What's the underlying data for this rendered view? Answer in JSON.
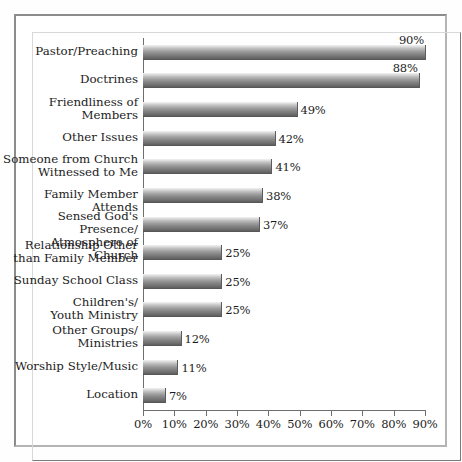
{
  "figure": {
    "background_color": "#ffffff",
    "frame_color": "#8c8c8c",
    "bar_color_top": "#f2f2f2",
    "bar_color_bottom": "#474747",
    "text_color": "#1c1c1c"
  },
  "chart_data": {
    "type": "bar",
    "orientation": "horizontal",
    "title": "",
    "subtitle": "",
    "xlabel": "",
    "ylabel": "",
    "xlim": [
      0,
      90
    ],
    "grid": false,
    "legend": false,
    "xticks": [
      0,
      10,
      20,
      30,
      40,
      50,
      60,
      70,
      80,
      90
    ],
    "xtick_labels": [
      "0%",
      "10%",
      "20%",
      "30%",
      "40%",
      "50%",
      "60%",
      "70%",
      "80%",
      "90%"
    ],
    "categories": [
      "Pastor/Preaching",
      "Doctrines",
      "Friendliness of\nMembers",
      "Other Issues",
      "Someone from Church\nWitnessed to Me",
      "Family Member Attends",
      "Sensed God's Presence/\nAtmosphere of Church",
      "Relationship Other\nthan Family Member",
      "Sunday School Class",
      "Children's/\nYouth Ministry",
      "Other Groups/\nMinistries",
      "Worship Style/Music",
      "Location"
    ],
    "values": [
      90,
      88,
      49,
      42,
      41,
      38,
      37,
      25,
      25,
      25,
      12,
      11,
      7
    ],
    "value_labels": [
      "90%",
      "88%",
      "49%",
      "42%",
      "41%",
      "38%",
      "37%",
      "25%",
      "25%",
      "25%",
      "12%",
      "11%",
      "7%"
    ],
    "value_label_position": [
      "above",
      "above",
      "right",
      "right",
      "right",
      "right",
      "right",
      "right",
      "right",
      "right",
      "right",
      "right",
      "right"
    ]
  }
}
